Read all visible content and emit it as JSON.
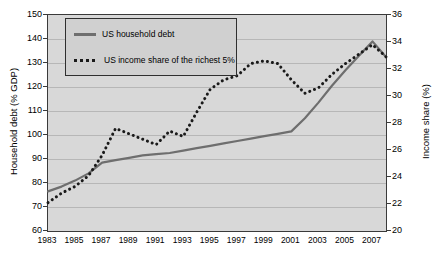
{
  "chart_data": {
    "type": "line",
    "title": "",
    "xlabel": "",
    "ylabel": "Household debt (% GDP)",
    "y2label": "Income share (%)",
    "grid": true,
    "legend_position": "top-left",
    "x": [
      1983,
      1984,
      1985,
      1986,
      1987,
      1988,
      1989,
      1990,
      1991,
      1992,
      1993,
      1994,
      1995,
      1996,
      1997,
      1998,
      1999,
      2000,
      2001,
      2002,
      2003,
      2004,
      2005,
      2006,
      2007,
      2008
    ],
    "xticks": [
      "1983",
      "1985",
      "1987",
      "1989",
      "1991",
      "1993",
      "1995",
      "1997",
      "1999",
      "2001",
      "2003",
      "2005",
      "2007"
    ],
    "xlim": [
      1983,
      2008
    ],
    "ylim": [
      60,
      150
    ],
    "yticks": [
      "60",
      "70",
      "80",
      "90",
      "100",
      "110",
      "120",
      "130",
      "140",
      "150"
    ],
    "y2lim": [
      20,
      36
    ],
    "y2ticks": [
      "20",
      "22",
      "24",
      "26",
      "28",
      "30",
      "32",
      "34",
      "36"
    ],
    "series": [
      {
        "name": "US household debt",
        "axis": "left",
        "style": "solid",
        "color": "#6e6e6e",
        "values": [
          76.5,
          78.5,
          81.0,
          84.0,
          88.5,
          89.5,
          90.5,
          91.5,
          92.0,
          92.5,
          93.5,
          94.5,
          95.5,
          96.5,
          97.5,
          98.5,
          99.5,
          100.5,
          101.5,
          107.0,
          113.5,
          120.5,
          127.0,
          133.0,
          139.0,
          132.5
        ]
      },
      {
        "name": "US income share of the richest 5%",
        "axis": "right",
        "style": "dotted",
        "color": "#1a1a1a",
        "values": [
          22.1,
          22.8,
          23.3,
          24.1,
          25.6,
          27.6,
          27.2,
          26.8,
          26.4,
          27.4,
          27.0,
          28.8,
          30.5,
          31.2,
          31.5,
          32.4,
          32.6,
          32.4,
          31.2,
          30.2,
          30.6,
          31.6,
          32.4,
          33.1,
          33.8,
          32.9
        ]
      }
    ]
  },
  "legend": {
    "items": [
      {
        "label": "US household debt",
        "style": "solid"
      },
      {
        "label": "US income share of the richest 5%",
        "style": "dotted"
      }
    ]
  }
}
